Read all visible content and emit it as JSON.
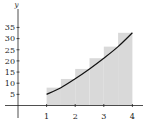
{
  "chart_data": {
    "type": "area",
    "title": "",
    "xlabel": "",
    "ylabel": "y",
    "xlim": [
      0,
      4.3
    ],
    "ylim": [
      0,
      38
    ],
    "x_ticks": [
      1,
      2,
      3,
      4
    ],
    "y_ticks": [
      5,
      10,
      15,
      20,
      25,
      30,
      35
    ],
    "grid": false,
    "legend": null,
    "curve": {
      "name": "f(x)",
      "x": [
        1,
        1.5,
        2,
        2.5,
        3,
        3.5,
        4
      ],
      "y": [
        5.0,
        8.0,
        12.0,
        16.4,
        21.2,
        26.4,
        32.6
      ]
    },
    "rectangles": {
      "description": "Right-endpoint Riemann sum, 6 subintervals of width 0.5 on [1,4]",
      "x_left": [
        1,
        1.5,
        2,
        2.5,
        3,
        3.5
      ],
      "width": 0.5,
      "heights": [
        8.0,
        11.9,
        16.4,
        21.2,
        26.4,
        32.6
      ],
      "fill": "#d9d9d9"
    }
  },
  "labels": {
    "y_axis": "y",
    "x_ticks": [
      "1",
      "2",
      "3",
      "4"
    ],
    "y_ticks": [
      "5",
      "10",
      "15",
      "20",
      "25",
      "30",
      "35"
    ]
  }
}
